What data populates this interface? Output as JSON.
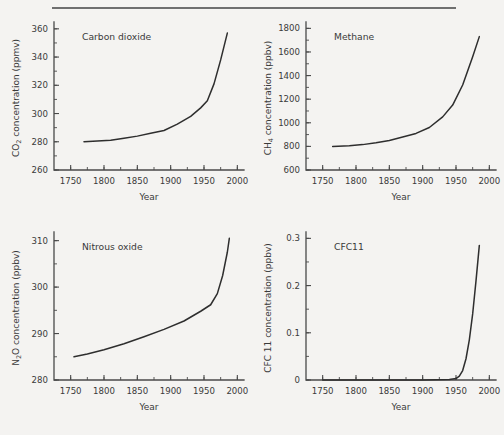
{
  "figure": {
    "background_color": "#f4f3f1",
    "line_color": "#2e2e2e",
    "axis_color": "#4a4a4a",
    "rule_color": "#6f6f6f"
  },
  "chart_data": [
    {
      "type": "line",
      "id": "carbon-dioxide",
      "title": "Carbon dioxide",
      "xlabel": "Year",
      "ylabel_prefix": "CO",
      "ylabel_sub": "2",
      "ylabel_suffix": " concentration (ppmv)",
      "ylabel_full": "CO2 concentration (ppmv)",
      "xlim": [
        1725,
        2010
      ],
      "ylim": [
        260,
        362
      ],
      "xticks": [
        1750,
        1800,
        1850,
        1900,
        1950,
        2000
      ],
      "xticklabels": [
        "1750",
        "1800",
        "1850",
        "1900",
        "1950",
        "2000"
      ],
      "xminor_step": 25,
      "yticks": [
        260,
        280,
        300,
        320,
        340,
        360
      ],
      "yticklabels": [
        "260",
        "280",
        "300",
        "320",
        "340",
        "360"
      ],
      "yminor_step": 10,
      "grid": false,
      "legend": "none",
      "x": [
        1770,
        1790,
        1810,
        1830,
        1850,
        1870,
        1890,
        1910,
        1930,
        1945,
        1955,
        1965,
        1975,
        1985
      ],
      "values": [
        280,
        280.5,
        281,
        282.5,
        284,
        286,
        288,
        292.5,
        298,
        304,
        309,
        321,
        338,
        357
      ]
    },
    {
      "type": "line",
      "id": "methane",
      "title": "Methane",
      "xlabel": "Year",
      "ylabel_prefix": "CH",
      "ylabel_sub": "4",
      "ylabel_suffix": " concentration (ppbv)",
      "ylabel_full": "CH4 concentration (ppbv)",
      "xlim": [
        1725,
        2010
      ],
      "ylim": [
        600,
        1820
      ],
      "xticks": [
        1750,
        1800,
        1850,
        1900,
        1950,
        2000
      ],
      "xticklabels": [
        "1750",
        "1800",
        "1850",
        "1900",
        "1950",
        "2000"
      ],
      "xminor_step": 25,
      "yticks": [
        600,
        800,
        1000,
        1200,
        1400,
        1600,
        1800
      ],
      "yticklabels": [
        "600",
        "800",
        "1000",
        "1200",
        "1400",
        "1600",
        "1800"
      ],
      "yminor_step": 100,
      "grid": false,
      "legend": "none",
      "x": [
        1765,
        1790,
        1810,
        1830,
        1850,
        1870,
        1890,
        1910,
        1930,
        1945,
        1960,
        1975,
        1985
      ],
      "values": [
        800,
        805,
        815,
        830,
        850,
        880,
        910,
        960,
        1050,
        1150,
        1320,
        1560,
        1730
      ]
    },
    {
      "type": "line",
      "id": "nitrous-oxide",
      "title": "Nitrous oxide",
      "xlabel": "Year",
      "ylabel_prefix": "N",
      "ylabel_sub": "2",
      "ylabel_suffix": "O concentration (ppbv)",
      "ylabel_full": "N2O concentration (ppbv)",
      "xlim": [
        1725,
        2010
      ],
      "ylim": [
        280,
        311
      ],
      "xticks": [
        1750,
        1800,
        1850,
        1900,
        1950,
        2000
      ],
      "xticklabels": [
        "1750",
        "1800",
        "1850",
        "1900",
        "1950",
        "2000"
      ],
      "xminor_step": 25,
      "yticks": [
        280,
        290,
        300,
        310
      ],
      "yticklabels": [
        "280",
        "290",
        "300",
        "310"
      ],
      "yminor_step": 5,
      "grid": false,
      "legend": "none",
      "x": [
        1755,
        1775,
        1800,
        1830,
        1860,
        1890,
        1920,
        1945,
        1960,
        1970,
        1978,
        1985,
        1988
      ],
      "values": [
        285,
        285.6,
        286.5,
        287.8,
        289.3,
        290.9,
        292.7,
        294.8,
        296.2,
        298.6,
        302.5,
        307.5,
        310.5
      ]
    },
    {
      "type": "line",
      "id": "cfc11",
      "title": "CFC11",
      "xlabel": "Year",
      "ylabel_prefix": "CFC 11",
      "ylabel_sub": "",
      "ylabel_suffix": " concentration (ppbv)",
      "ylabel_full": "CFC 11 concentration (ppbv)",
      "xlim": [
        1725,
        2010
      ],
      "ylim": [
        0,
        0.305
      ],
      "xticks": [
        1750,
        1800,
        1850,
        1900,
        1950,
        2000
      ],
      "xticklabels": [
        "1750",
        "1800",
        "1850",
        "1900",
        "1950",
        "2000"
      ],
      "xminor_step": 25,
      "yticks": [
        0,
        0.1,
        0.2,
        0.3
      ],
      "yticklabels": [
        "0",
        "0.1",
        "0.2",
        "0.3"
      ],
      "yminor_step": 0.05,
      "grid": false,
      "legend": "none",
      "x": [
        1750,
        1900,
        1940,
        1950,
        1955,
        1960,
        1965,
        1970,
        1975,
        1980,
        1985
      ],
      "values": [
        0,
        0,
        0.001,
        0.003,
        0.008,
        0.02,
        0.045,
        0.085,
        0.14,
        0.21,
        0.285
      ]
    }
  ]
}
